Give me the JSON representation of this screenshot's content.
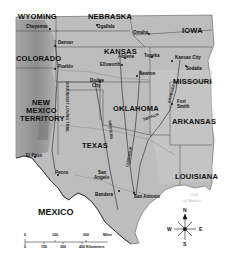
{
  "map": {
    "colors": {
      "land": "#b8b8b8",
      "land_light": "#cfcfcf",
      "mountain": "#8a8a8a",
      "water": "#ffffff",
      "border": "#333333",
      "route": "#222222"
    },
    "states": [
      {
        "name": "WYOMING",
        "x": 18,
        "y": 17
      },
      {
        "name": "NEBRASKA",
        "x": 88,
        "y": 17
      },
      {
        "name": "IOWA",
        "x": 182,
        "y": 30
      },
      {
        "name": "KANSAS",
        "x": 104,
        "y": 52
      },
      {
        "name": "MISSOURI",
        "x": 173,
        "y": 81
      },
      {
        "name": "COLORADO",
        "x": 16,
        "y": 58
      },
      {
        "name": "NEW",
        "x": 32,
        "y": 102
      },
      {
        "name": "MEXICO",
        "x": 26,
        "y": 110
      },
      {
        "name": "TERRITORY",
        "x": 20,
        "y": 118
      },
      {
        "name": "OKLAHOMA",
        "x": 113,
        "y": 108
      },
      {
        "name": "ARKANSAS",
        "x": 172,
        "y": 121
      },
      {
        "name": "TEXAS",
        "x": 82,
        "y": 145
      },
      {
        "name": "LOUISIANA",
        "x": 175,
        "y": 176
      }
    ],
    "cities": [
      {
        "name": "Cheyenne",
        "x": 26,
        "y": 27
      },
      {
        "name": "Ogallala",
        "x": 97,
        "y": 27
      },
      {
        "name": "Omaha",
        "x": 133,
        "y": 33
      },
      {
        "name": "Denver",
        "x": 58,
        "y": 43
      },
      {
        "name": "Abilene",
        "x": 118,
        "y": 57
      },
      {
        "name": "Topeka",
        "x": 147,
        "y": 56
      },
      {
        "name": "Kansas City",
        "x": 177,
        "y": 58
      },
      {
        "name": "Sedalia",
        "x": 186,
        "y": 68
      },
      {
        "name": "Ellsworth",
        "x": 100,
        "y": 65
      },
      {
        "name": "Newton",
        "x": 138,
        "y": 73
      },
      {
        "name": "Pueblo",
        "x": 58,
        "y": 67
      },
      {
        "name": "Dodge",
        "x": 90,
        "y": 80
      },
      {
        "name": "City",
        "x": 92,
        "y": 86
      },
      {
        "name": "Fort",
        "x": 177,
        "y": 101
      },
      {
        "name": "Smith",
        "x": 177,
        "y": 107
      },
      {
        "name": "El Paso",
        "x": 26,
        "y": 155
      },
      {
        "name": "Pecos",
        "x": 55,
        "y": 172
      },
      {
        "name": "San",
        "x": 98,
        "y": 172
      },
      {
        "name": "Angelo",
        "x": 94,
        "y": 178
      },
      {
        "name": "Bandera",
        "x": 95,
        "y": 193
      },
      {
        "name": "San Antonio",
        "x": 134,
        "y": 197
      }
    ],
    "trails": [
      {
        "name": "GOODNIGHT-LOVING TRAIL",
        "x": 57,
        "y": 94,
        "rotate": 90
      },
      {
        "name": "GOODNIGHT",
        "x": 50,
        "y": 140,
        "rotate": -80
      },
      {
        "name": "WESTERN",
        "x": 107,
        "y": 128,
        "rotate": 85
      },
      {
        "name": "TRAIL",
        "x": 117,
        "y": 115,
        "rotate": 85
      },
      {
        "name": "CHISHOLM",
        "x": 127,
        "y": 157,
        "rotate": -80
      },
      {
        "name": "SHAWNEE",
        "x": 170,
        "y": 92,
        "rotate": -75
      },
      {
        "name": "SEDALIA",
        "x": 148,
        "y": 118,
        "rotate": -20
      },
      {
        "name": "TRAIL",
        "x": 131,
        "y": 131,
        "rotate": -75
      }
    ],
    "country": {
      "name": "MEXICO",
      "x": 38,
      "y": 208
    },
    "water": [
      {
        "name": "Gulf",
        "x": 190,
        "y": 196
      },
      {
        "name": "of Mexico",
        "x": 183,
        "y": 202
      }
    ],
    "scale": {
      "miles_ticks": [
        "0",
        "100",
        "200"
      ],
      "miles_label": "Miles",
      "km_ticks": [
        "0",
        "150",
        "300",
        "450 Kilometers"
      ]
    },
    "compass": {
      "n": "N",
      "s": "S",
      "e": "E",
      "w": "W"
    }
  }
}
